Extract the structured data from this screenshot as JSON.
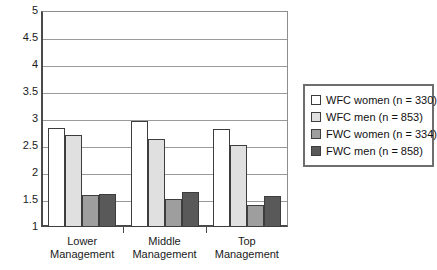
{
  "chart_data": {
    "type": "bar",
    "title": "",
    "subtitle": "",
    "xlabel": "",
    "ylabel": "",
    "categories": [
      "Lower Management",
      "Middle Management",
      "Top Management"
    ],
    "category_lines": [
      [
        "Lower",
        "Management"
      ],
      [
        "Middle",
        "Management"
      ],
      [
        "Top",
        "Management"
      ]
    ],
    "series": [
      {
        "name": "WFC women (n = 330)",
        "values": [
          2.83,
          2.97,
          2.81
        ],
        "color": "#ffffff"
      },
      {
        "name": "WFC men (n = 853)",
        "values": [
          2.7,
          2.63,
          2.51
        ],
        "color": "#e0e0e0"
      },
      {
        "name": "FWC women (n = 334)",
        "values": [
          1.6,
          1.52,
          1.4
        ],
        "color": "#9e9e9e"
      },
      {
        "name": "FWC men (n = 858)",
        "values": [
          1.61,
          1.65,
          1.58
        ],
        "color": "#595959"
      }
    ],
    "ylim": [
      1,
      5
    ],
    "ytick_values": [
      1,
      1.5,
      2,
      2.5,
      3,
      3.5,
      4,
      4.5,
      5
    ],
    "ytick_labels": [
      "1",
      "1.5",
      "2",
      "2.5",
      "3",
      "3.5",
      "4",
      "4.5",
      "5"
    ],
    "grid": true,
    "legend_position": "right",
    "bar_border_color": "#3d3d3d",
    "axis_color": "#4a4a4a",
    "grid_color": "#9a9a9a"
  },
  "legend": {
    "items": [
      {
        "label": "WFC women (n = 330)",
        "color": "#ffffff"
      },
      {
        "label": "WFC men (n = 853)",
        "color": "#e0e0e0"
      },
      {
        "label": "FWC women (n = 334)",
        "color": "#9e9e9e"
      },
      {
        "label": "FWC men (n = 858)",
        "color": "#595959"
      }
    ]
  }
}
